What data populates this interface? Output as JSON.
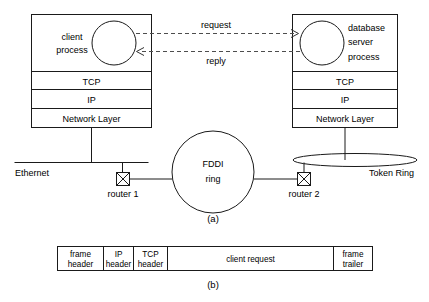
{
  "figure": {
    "part_a_label": "(a)",
    "part_b_label": "(b)"
  },
  "client_host": {
    "process_line1": "client",
    "process_line2": "process",
    "layers": [
      {
        "label": "TCP"
      },
      {
        "label": "IP"
      },
      {
        "label": "Network Layer"
      }
    ]
  },
  "server_host": {
    "process_line1": "database",
    "process_line2": "server",
    "process_line3": "process",
    "layers": [
      {
        "label": "TCP"
      },
      {
        "label": "IP"
      },
      {
        "label": "Network Layer"
      }
    ]
  },
  "messages": {
    "request_label": "request",
    "reply_label": "reply"
  },
  "networks": {
    "ethernet_label": "Ethernet",
    "fddi_line1": "FDDI",
    "fddi_line2": "ring",
    "token_ring_label": "Token Ring"
  },
  "routers": [
    {
      "label": "router 1"
    },
    {
      "label": "router 2"
    }
  ],
  "frame": {
    "cells": [
      {
        "line1": "frame",
        "line2": "header"
      },
      {
        "line1": "IP",
        "line2": "header"
      },
      {
        "line1": "TCP",
        "line2": "header"
      },
      {
        "line1": "client request",
        "line2": ""
      },
      {
        "line1": "frame",
        "line2": "trailer"
      }
    ]
  },
  "colors": {
    "stroke": "#1a1a1a",
    "dashed": "#4d4d4d",
    "background": "#ffffff"
  }
}
